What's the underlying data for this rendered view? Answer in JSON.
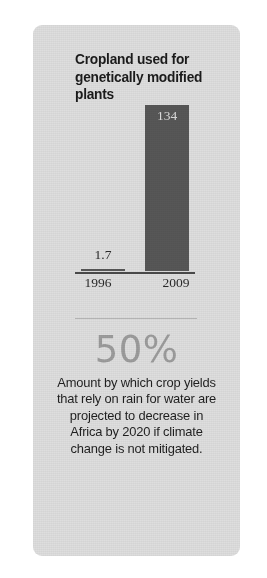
{
  "card": {
    "background_color": "#dedede"
  },
  "chart_data": {
    "type": "bar",
    "title": "Cropland used for genetically modified plants",
    "categories": [
      "1996",
      "2009"
    ],
    "values": [
      1.7,
      134
    ],
    "value_labels": [
      "1.7",
      "134"
    ],
    "xlabel": "",
    "ylabel": "",
    "ylim": [
      0,
      134
    ],
    "grid": false,
    "legend": false,
    "bar_color": "#575757",
    "value_label_color_inside": "#dcdcdc",
    "value_label_color_outside": "#2a2a2a"
  },
  "stat": {
    "figure": "50%",
    "figure_color": "#9c9c9c",
    "caption": "Amount by which crop yields that rely on rain for water are projected to decrease in Africa by 2020 if climate change is not mitigated."
  }
}
